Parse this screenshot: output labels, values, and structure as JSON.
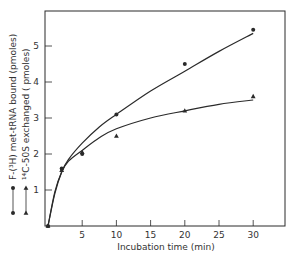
{
  "chart_data": {
    "type": "line",
    "title": "",
    "xlabel": "Incubation time (min)",
    "ylabel": "",
    "xlim": [
      0,
      35
    ],
    "ylim": [
      0,
      5.9
    ],
    "grid": false,
    "x_ticks": [
      5,
      10,
      15,
      20,
      25,
      30
    ],
    "y_ticks": [
      1,
      2,
      3,
      4,
      5
    ],
    "legend_position": "left, rotated vertically beside y-axis",
    "series": [
      {
        "name": "F-(³H) met-tRNA bound (pmoles)",
        "marker": "circle",
        "x": [
          0,
          2,
          5,
          10,
          20,
          30
        ],
        "values": [
          0,
          1.6,
          2.0,
          3.1,
          4.5,
          5.45
        ],
        "fit_curve": [
          [
            0,
            0
          ],
          [
            1,
            0.9
          ],
          [
            2,
            1.5
          ],
          [
            3,
            1.85
          ],
          [
            5,
            2.3
          ],
          [
            7.5,
            2.75
          ],
          [
            10,
            3.1
          ],
          [
            15,
            3.75
          ],
          [
            20,
            4.3
          ],
          [
            25,
            4.85
          ],
          [
            30,
            5.35
          ]
        ]
      },
      {
        "name": "¹⁴C-50S exchanged ( pmoles)",
        "marker": "triangle",
        "x": [
          0,
          2,
          5,
          10,
          20,
          30
        ],
        "values": [
          0,
          1.55,
          2.05,
          2.5,
          3.2,
          3.6
        ],
        "fit_curve": [
          [
            0,
            0
          ],
          [
            1,
            0.95
          ],
          [
            2,
            1.5
          ],
          [
            3,
            1.8
          ],
          [
            5,
            2.1
          ],
          [
            7.5,
            2.45
          ],
          [
            10,
            2.7
          ],
          [
            15,
            3.0
          ],
          [
            20,
            3.2
          ],
          [
            25,
            3.38
          ],
          [
            30,
            3.5
          ]
        ]
      }
    ],
    "legend": [
      {
        "marker": "circle",
        "label": "F-(³H) met-tRNA bound (pmoles)"
      },
      {
        "marker": "triangle",
        "label": "¹⁴C-50S exchanged ( pmoles)"
      }
    ]
  }
}
